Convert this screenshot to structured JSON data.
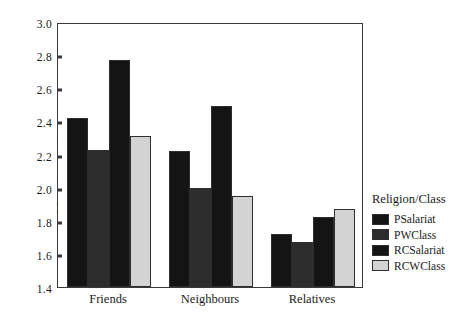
{
  "chart_data": {
    "type": "bar",
    "title": "",
    "xlabel": "",
    "ylabel": "Mean integration score",
    "ylim": [
      1.4,
      3.0
    ],
    "yticks": [
      "1.4",
      "1.6",
      "1.8",
      "2.0",
      "2.2",
      "2.4",
      "2.6",
      "2.8",
      "3.0"
    ],
    "grid": false,
    "legend_position": "right",
    "legend_title": "Religion/Class",
    "categories": [
      "Friends",
      "Neighbours",
      "Relatives"
    ],
    "series": [
      {
        "name": "PSalariat",
        "color": "#141414",
        "values": [
          2.42,
          2.22,
          1.72
        ]
      },
      {
        "name": "PWClass",
        "color": "#2d2d2d",
        "values": [
          2.23,
          2.0,
          1.67
        ]
      },
      {
        "name": "RCSalariat",
        "color": "#141414",
        "values": [
          2.77,
          2.49,
          1.82
        ]
      },
      {
        "name": "RCWClass",
        "color": "#d3d3d3",
        "values": [
          2.31,
          1.95,
          1.87
        ]
      }
    ]
  }
}
